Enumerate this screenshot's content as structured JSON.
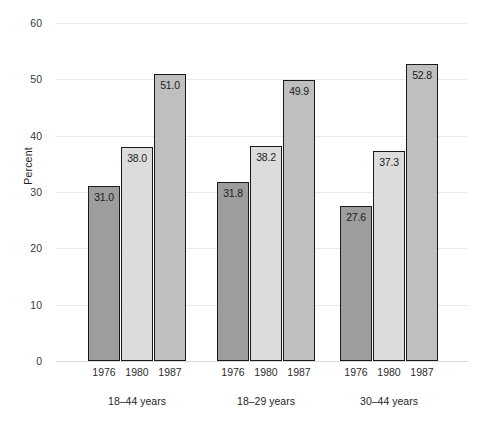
{
  "chart_data": {
    "type": "bar",
    "title": "",
    "xlabel": "",
    "ylabel": "Percent",
    "ylim": [
      0,
      60
    ],
    "yticks": [
      0,
      10,
      20,
      30,
      40,
      50,
      60
    ],
    "ytick_labels": [
      "0",
      "10",
      "20",
      "30",
      "40",
      "50",
      "60"
    ],
    "grid": true,
    "legend": "none",
    "categories": [
      "1976",
      "1980",
      "1987"
    ],
    "groups": [
      {
        "label": "18–44 years",
        "bars": [
          {
            "category": "1976",
            "value": 31.0,
            "value_label": "31.0",
            "color": "#9d9d9d"
          },
          {
            "category": "1980",
            "value": 38.0,
            "value_label": "38.0",
            "color": "#dcdcdc"
          },
          {
            "category": "1987",
            "value": 51.0,
            "value_label": "51.0",
            "color": "#bfbfbf"
          }
        ]
      },
      {
        "label": "18–29 years",
        "bars": [
          {
            "category": "1976",
            "value": 31.8,
            "value_label": "31.8",
            "color": "#9d9d9d"
          },
          {
            "category": "1980",
            "value": 38.2,
            "value_label": "38.2",
            "color": "#dcdcdc"
          },
          {
            "category": "1987",
            "value": 49.9,
            "value_label": "49.9",
            "color": "#bfbfbf"
          }
        ]
      },
      {
        "label": "30–44 years",
        "bars": [
          {
            "category": "1976",
            "value": 27.6,
            "value_label": "27.6",
            "color": "#9d9d9d"
          },
          {
            "category": "1980",
            "value": 37.3,
            "value_label": "37.3",
            "color": "#dcdcdc"
          },
          {
            "category": "1987",
            "value": 52.8,
            "value_label": "52.8",
            "color": "#bfbfbf"
          }
        ]
      }
    ]
  }
}
